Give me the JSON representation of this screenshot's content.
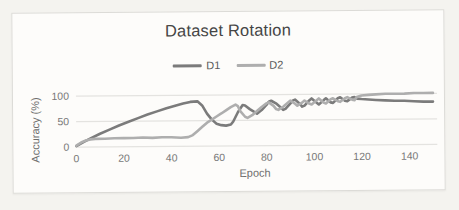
{
  "colors": {
    "paper_bg": "#f4f3ef",
    "card_bg": "#fdfcfa",
    "card_border": "#dcdbd7",
    "grid": "#e4e3e0",
    "tick_text": "#787878",
    "title_text": "#454545"
  },
  "chart_data": {
    "type": "line",
    "title": "Dataset Rotation",
    "xlabel": "Epoch",
    "ylabel": "Accuracy (%)",
    "xlim": [
      0,
      150
    ],
    "ylim": [
      0,
      100
    ],
    "x_ticks": [
      0,
      20,
      40,
      60,
      80,
      100,
      120,
      140
    ],
    "y_ticks": [
      0,
      50,
      100
    ],
    "grid": "horizontal-only",
    "legend_position": "top-center",
    "series": [
      {
        "name": "D1",
        "color": "#7b7b7b",
        "points": [
          [
            0,
            2
          ],
          [
            3,
            10
          ],
          [
            6,
            17
          ],
          [
            10,
            26
          ],
          [
            14,
            34
          ],
          [
            18,
            42
          ],
          [
            22,
            49
          ],
          [
            26,
            56
          ],
          [
            30,
            63
          ],
          [
            34,
            69
          ],
          [
            38,
            75
          ],
          [
            42,
            80
          ],
          [
            45,
            84
          ],
          [
            48,
            87
          ],
          [
            51,
            88
          ],
          [
            53,
            80
          ],
          [
            55,
            64
          ],
          [
            57,
            52
          ],
          [
            59,
            44
          ],
          [
            61,
            41
          ],
          [
            63,
            40
          ],
          [
            65,
            42
          ],
          [
            66,
            48
          ],
          [
            68,
            66
          ],
          [
            70,
            80
          ],
          [
            71,
            79
          ],
          [
            73,
            72
          ],
          [
            75,
            66
          ],
          [
            76,
            63
          ],
          [
            78,
            70
          ],
          [
            80,
            80
          ],
          [
            81,
            86
          ],
          [
            82,
            88
          ],
          [
            84,
            83
          ],
          [
            86,
            75
          ],
          [
            87,
            70
          ],
          [
            88,
            72
          ],
          [
            90,
            82
          ],
          [
            91,
            88
          ],
          [
            92,
            90
          ],
          [
            94,
            82
          ],
          [
            95,
            76
          ],
          [
            96,
            78
          ],
          [
            98,
            88
          ],
          [
            99,
            92
          ],
          [
            101,
            84
          ],
          [
            102,
            80
          ],
          [
            104,
            88
          ],
          [
            105,
            92
          ],
          [
            107,
            84
          ],
          [
            108,
            83
          ],
          [
            110,
            92
          ],
          [
            111,
            94
          ],
          [
            113,
            87
          ],
          [
            114,
            86
          ],
          [
            116,
            93
          ],
          [
            117,
            94
          ],
          [
            118,
            91
          ],
          [
            120,
            90
          ],
          [
            123,
            89
          ],
          [
            126,
            88
          ],
          [
            130,
            87
          ],
          [
            134,
            86
          ],
          [
            138,
            86
          ],
          [
            142,
            85
          ],
          [
            146,
            84
          ],
          [
            150,
            84
          ]
        ]
      },
      {
        "name": "D2",
        "color": "#aeaeae",
        "points": [
          [
            0,
            3
          ],
          [
            2,
            9
          ],
          [
            4,
            13
          ],
          [
            6,
            15
          ],
          [
            8,
            16
          ],
          [
            12,
            16
          ],
          [
            16,
            17
          ],
          [
            20,
            17
          ],
          [
            24,
            17
          ],
          [
            28,
            18
          ],
          [
            32,
            17
          ],
          [
            36,
            18
          ],
          [
            40,
            18
          ],
          [
            44,
            17
          ],
          [
            47,
            18
          ],
          [
            49,
            22
          ],
          [
            51,
            30
          ],
          [
            53,
            38
          ],
          [
            55,
            46
          ],
          [
            57,
            52
          ],
          [
            59,
            58
          ],
          [
            61,
            64
          ],
          [
            63,
            70
          ],
          [
            65,
            76
          ],
          [
            67,
            81
          ],
          [
            68,
            78
          ],
          [
            69,
            68
          ],
          [
            71,
            57
          ],
          [
            72,
            55
          ],
          [
            74,
            60
          ],
          [
            76,
            68
          ],
          [
            78,
            76
          ],
          [
            80,
            83
          ],
          [
            81,
            85
          ],
          [
            83,
            78
          ],
          [
            84,
            72
          ],
          [
            85,
            70
          ],
          [
            87,
            76
          ],
          [
            89,
            84
          ],
          [
            90,
            88
          ],
          [
            92,
            82
          ],
          [
            93,
            78
          ],
          [
            95,
            84
          ],
          [
            96,
            88
          ],
          [
            98,
            82
          ],
          [
            99,
            80
          ],
          [
            101,
            88
          ],
          [
            102,
            92
          ],
          [
            104,
            84
          ],
          [
            105,
            82
          ],
          [
            107,
            90
          ],
          [
            108,
            92
          ],
          [
            110,
            86
          ],
          [
            111,
            85
          ],
          [
            113,
            92
          ],
          [
            114,
            94
          ],
          [
            116,
            89
          ],
          [
            117,
            88
          ],
          [
            118,
            94
          ],
          [
            120,
            97
          ],
          [
            123,
            98
          ],
          [
            126,
            99
          ],
          [
            130,
            100
          ],
          [
            134,
            100
          ],
          [
            138,
            100
          ],
          [
            142,
            101
          ],
          [
            146,
            101
          ],
          [
            150,
            101
          ]
        ]
      }
    ]
  }
}
